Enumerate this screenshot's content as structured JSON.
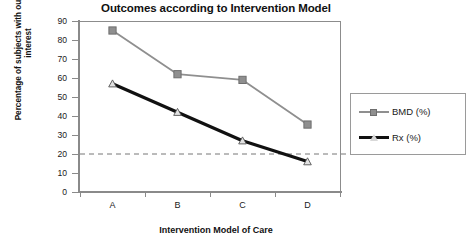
{
  "chart_data": {
    "type": "line",
    "title": "Outcomes according to Intervention Model",
    "xlabel": "Intervention Model of Care",
    "ylabel": "Percentage of subjects with outcome of interest",
    "categories": [
      "A",
      "B",
      "C",
      "D"
    ],
    "series": [
      {
        "name": "BMD (%)",
        "values": [
          85,
          62,
          59,
          35.5
        ],
        "color": "#8f8f8f",
        "marker": "square"
      },
      {
        "name": "Rx (%)",
        "values": [
          57,
          42,
          27,
          16
        ],
        "color": "#111111",
        "marker": "triangle"
      }
    ],
    "ylim": [
      0,
      90
    ],
    "yticks": [
      0,
      10,
      20,
      30,
      40,
      50,
      60,
      70,
      80,
      90
    ],
    "ytick_labels": [
      "0",
      "10",
      "20",
      "30",
      "40",
      "50",
      "60",
      "70",
      "80",
      "90"
    ],
    "grid": false,
    "legend_position": "right",
    "annotations": [
      {
        "type": "hline",
        "value": 20,
        "style": "dashed",
        "color": "#777777",
        "label": ""
      }
    ]
  },
  "legend": {
    "entries": [
      {
        "label": "BMD (%)"
      },
      {
        "label": "Rx (%)"
      }
    ]
  },
  "axes": {
    "y_title_line1": "Percentage of subjects with outcome of",
    "y_title_line2": "interest"
  }
}
